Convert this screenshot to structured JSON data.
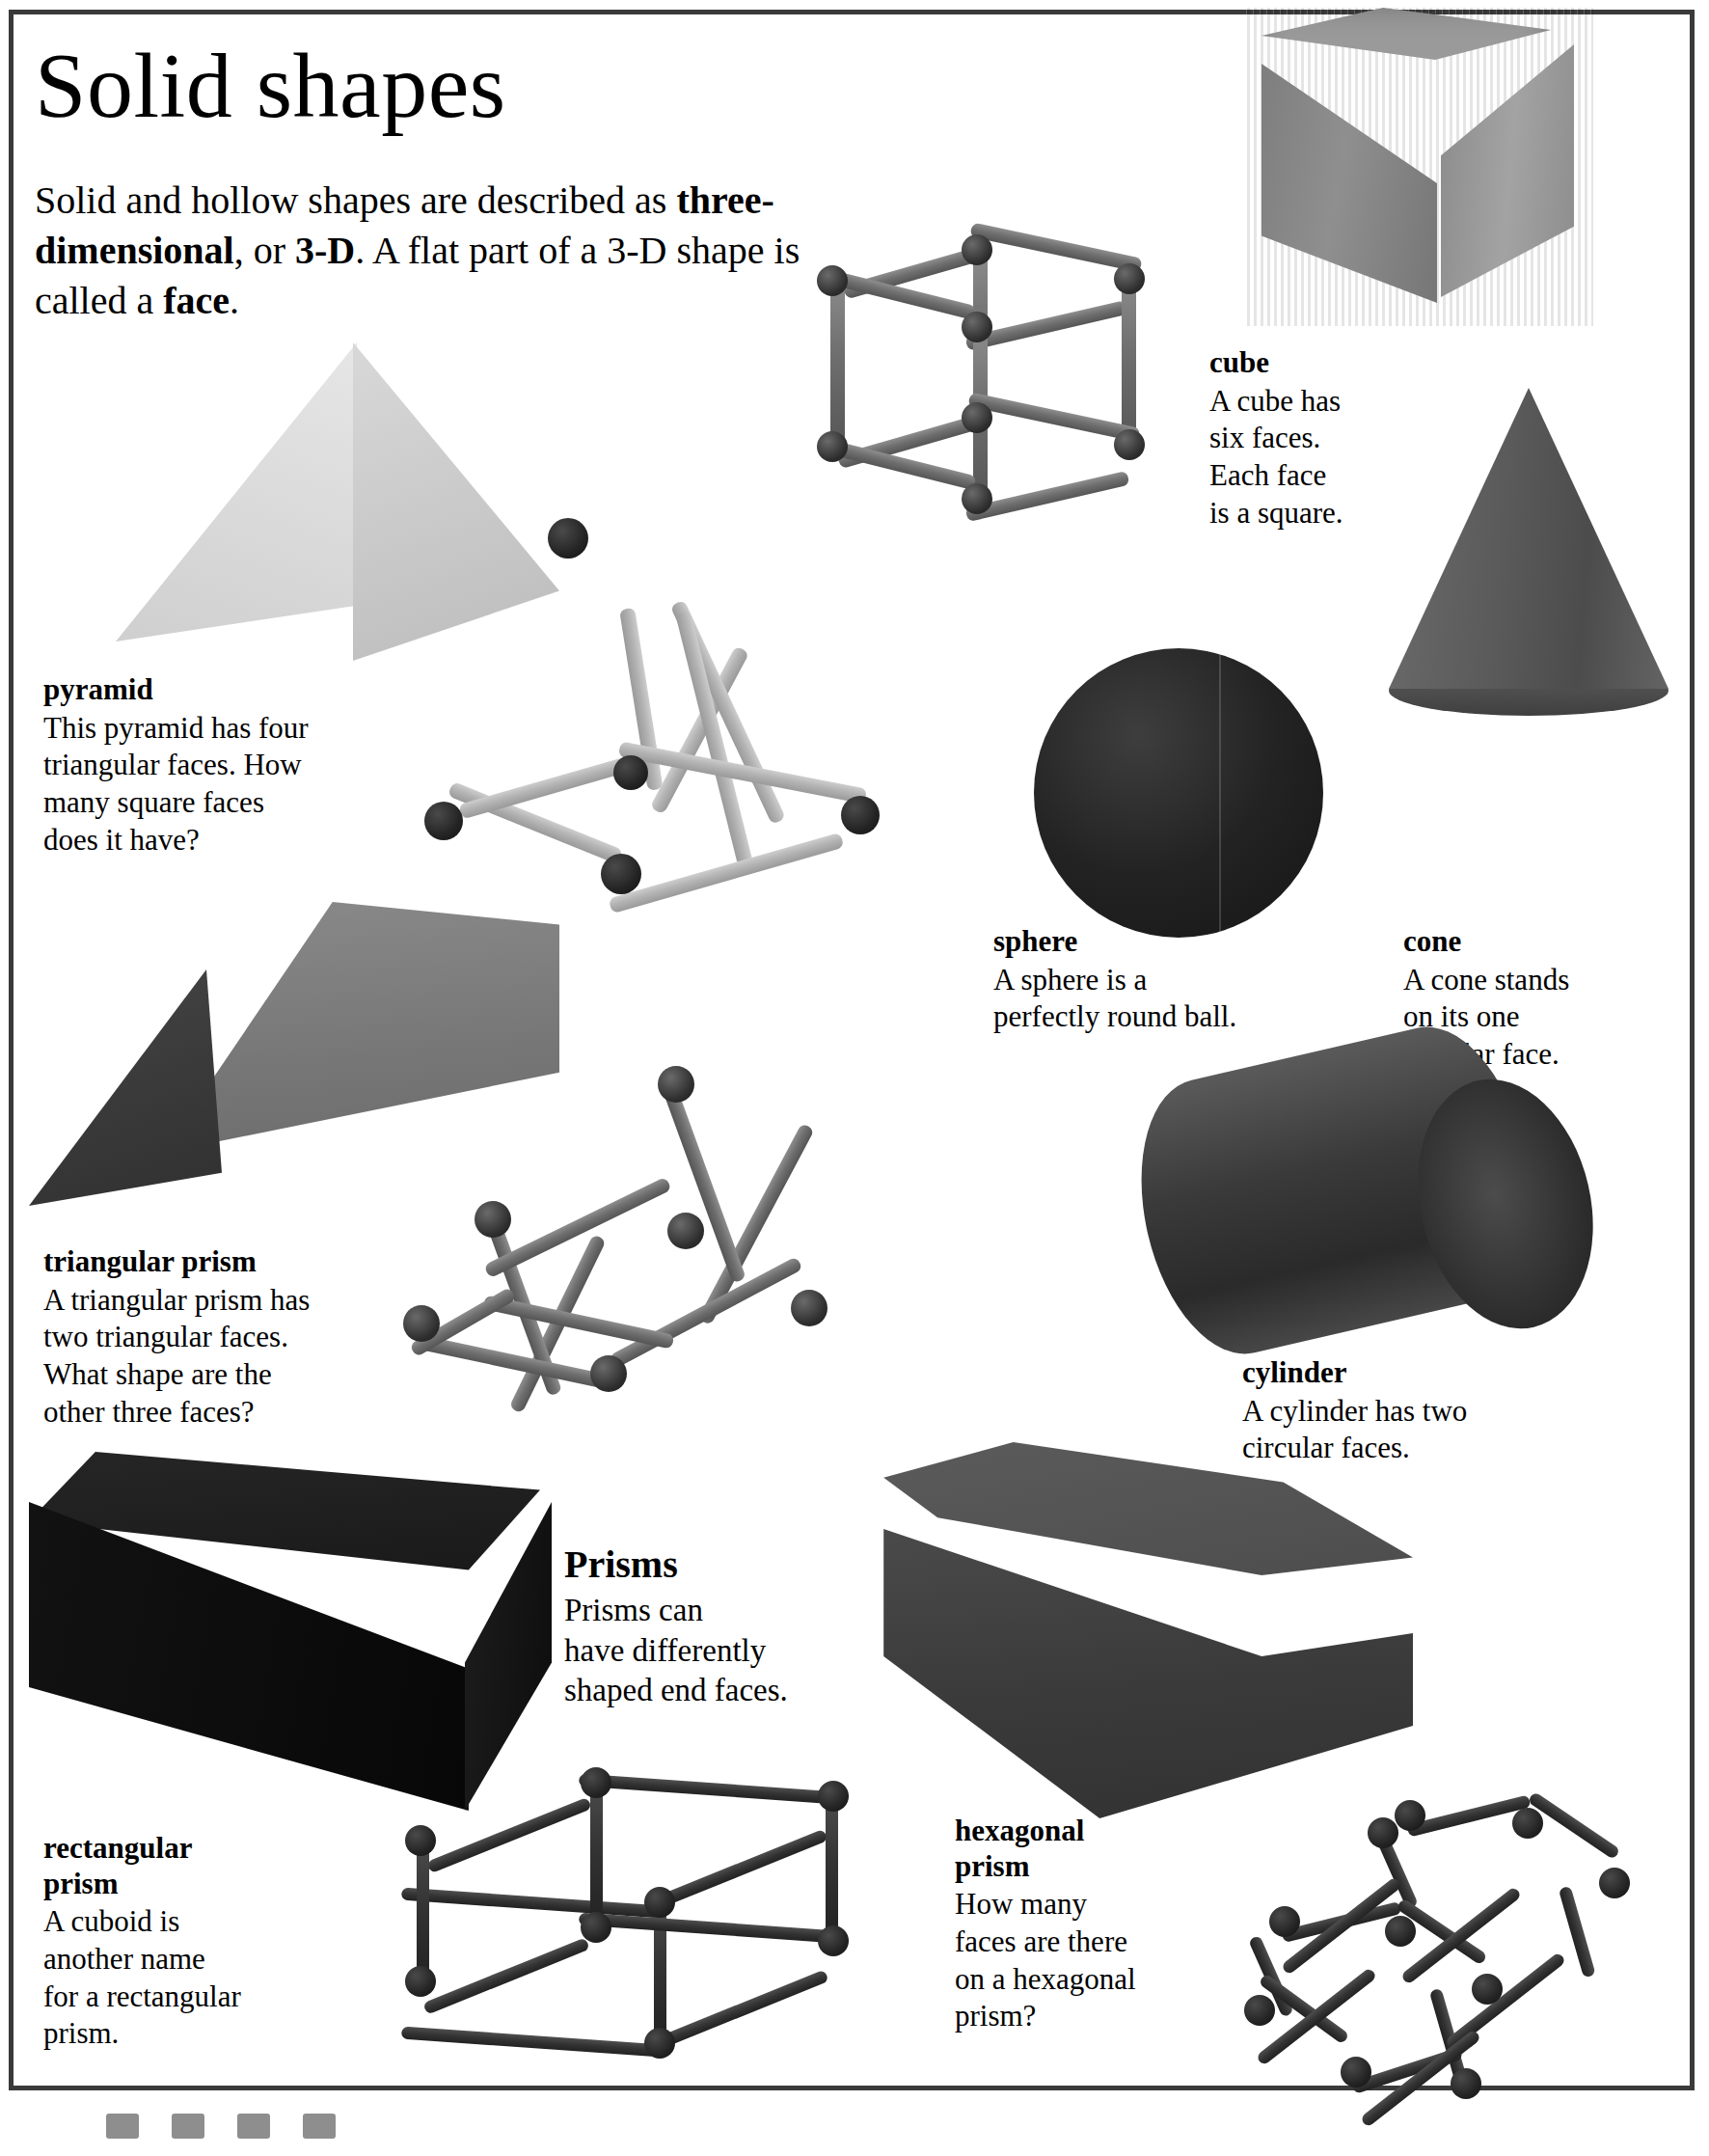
{
  "page": {
    "title": "Solid shapes",
    "intro_parts": [
      {
        "text": "Solid and hollow shapes are described as ",
        "bold": false
      },
      {
        "text": "three-dimensional",
        "bold": true
      },
      {
        "text": ", or ",
        "bold": false
      },
      {
        "text": "3-D",
        "bold": true
      },
      {
        "text": ". A flat part of a 3-D shape is called a ",
        "bold": false
      },
      {
        "text": "face",
        "bold": true
      },
      {
        "text": ".",
        "bold": false
      }
    ],
    "intro_plain": "Solid and hollow shapes are described as three-dimensional, or 3-D. A flat part of a 3-D shape is called a face.",
    "border_color": "#3a3a3a",
    "background_color": "#ffffff"
  },
  "captions": {
    "cube": {
      "heading": "cube",
      "body": "A cube has\nsix faces.\nEach face\nis a square."
    },
    "pyramid": {
      "heading": "pyramid",
      "body": "This pyramid has four\ntriangular faces. How\nmany square faces\ndoes it have?"
    },
    "sphere": {
      "heading": "sphere",
      "body": "A sphere is a\nperfectly round ball."
    },
    "cone": {
      "heading": "cone",
      "body": "A cone stands\non its one\ncircular face."
    },
    "triangular_prism": {
      "heading": "triangular prism",
      "body": "A triangular prism has\ntwo triangular faces.\nWhat shape are the\nother three faces?"
    },
    "cylinder": {
      "heading": "cylinder",
      "body": "A cylinder has two\ncircular faces."
    },
    "prisms": {
      "heading": "Prisms",
      "body": "Prisms can\nhave differently\nshaped end faces."
    },
    "rectangular_prism": {
      "heading": "rectangular\nprism",
      "body": "A cuboid is\nanother name\nfor a rectangular\nprism."
    },
    "hexagonal_prism": {
      "heading": "hexagonal\nprism",
      "body": "How many\nfaces are there\non a hexagonal\nprism?"
    }
  },
  "objects": [
    {
      "name": "cube-photo",
      "kind": "solid-wooden-cube",
      "color": "#8f8f8f"
    },
    {
      "name": "cube-stick-model",
      "kind": "wireframe-cube",
      "rod_color": "#7a7a7a",
      "joint_color": "#2e2e2e"
    },
    {
      "name": "pyramid-photo",
      "kind": "solid-wooden-pyramid",
      "color": "#d8d8d8"
    },
    {
      "name": "pyramid-stick-model",
      "kind": "wireframe-square-pyramid",
      "rod_color": "#bdbdbd",
      "joint_color": "#2a2a2a"
    },
    {
      "name": "sphere-photo",
      "kind": "solid-ball",
      "color": "#232323"
    },
    {
      "name": "cone-photo",
      "kind": "solid-wooden-cone",
      "color": "#5a5a5a"
    },
    {
      "name": "triangular-prism-photo",
      "kind": "solid-wooden-triangular-prism",
      "color": "#7a7a7a"
    },
    {
      "name": "triangular-prism-stick-model",
      "kind": "wireframe-triangular-prism",
      "rod_color": "#9a9a9a",
      "joint_color": "#242424"
    },
    {
      "name": "cylinder-photo",
      "kind": "solid-wooden-cylinder",
      "color": "#3a3a3a"
    },
    {
      "name": "hexagonal-prism-photo",
      "kind": "solid-wooden-hexagonal-prism",
      "color": "#454545"
    },
    {
      "name": "rectangular-prism-photo",
      "kind": "solid-wooden-cuboid",
      "color": "#0e0e0e"
    },
    {
      "name": "rectangular-prism-stick-model",
      "kind": "wireframe-cuboid",
      "rod_color": "#1e1e1e",
      "joint_color": "#111111"
    },
    {
      "name": "hexagonal-prism-stick-model",
      "kind": "wireframe-hexagonal-prism",
      "rod_color": "#1e1e1e",
      "joint_color": "#111111"
    }
  ]
}
